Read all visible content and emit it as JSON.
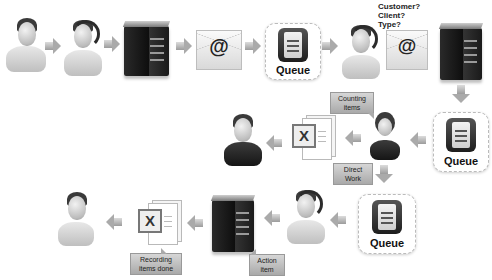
{
  "diagram": {
    "type": "workflow",
    "row1": {
      "nodes": [
        {
          "id": "customer",
          "kind": "person",
          "label": ""
        },
        {
          "id": "agent-1",
          "kind": "person-headset",
          "label": ""
        },
        {
          "id": "server-1",
          "kind": "server",
          "label": ""
        },
        {
          "id": "email-1",
          "kind": "email",
          "symbol": "@"
        },
        {
          "id": "queue-1",
          "kind": "queue",
          "label": "Queue"
        },
        {
          "id": "agent-2",
          "kind": "person-headset",
          "label": ""
        },
        {
          "id": "email-2",
          "kind": "email",
          "symbol": "@"
        },
        {
          "id": "server-2",
          "kind": "server",
          "label": ""
        }
      ],
      "questions": [
        "Customer?",
        "Client?",
        "Type?"
      ]
    },
    "row2": {
      "nodes": [
        {
          "id": "queue-2",
          "kind": "queue",
          "label": "Queue"
        },
        {
          "id": "operator",
          "kind": "person-female-headset",
          "label": ""
        },
        {
          "id": "excel-1",
          "kind": "excel-document",
          "symbol": "X"
        },
        {
          "id": "manager",
          "kind": "person-suit",
          "label": ""
        }
      ],
      "callouts": {
        "counting": "Counting items",
        "direct": "Direct Work"
      }
    },
    "row3": {
      "nodes": [
        {
          "id": "queue-3",
          "kind": "queue",
          "label": "Queue"
        },
        {
          "id": "agent-3",
          "kind": "person-headset",
          "label": ""
        },
        {
          "id": "server-3",
          "kind": "server",
          "label": ""
        },
        {
          "id": "excel-2",
          "kind": "excel-document",
          "symbol": "X"
        },
        {
          "id": "customer-end",
          "kind": "person",
          "label": ""
        }
      ],
      "callouts": {
        "action": "Action item",
        "recording": "Recording items done"
      }
    },
    "labels": {
      "queue": "Queue",
      "at": "@",
      "x": "X",
      "q1": "Customer?",
      "q2": "Client?",
      "q3": "Type?",
      "counting_1": "Counting",
      "counting_2": "items",
      "direct_1": "Direct",
      "direct_2": "Work",
      "action_1": "Action",
      "action_2": "item",
      "recording_1": "Recording",
      "recording_2": "items done"
    },
    "colors": {
      "background": "#ffffff",
      "arrow": "#b0b0b0",
      "server": "#1a1a1a",
      "callout": "#bdbdbd"
    }
  }
}
